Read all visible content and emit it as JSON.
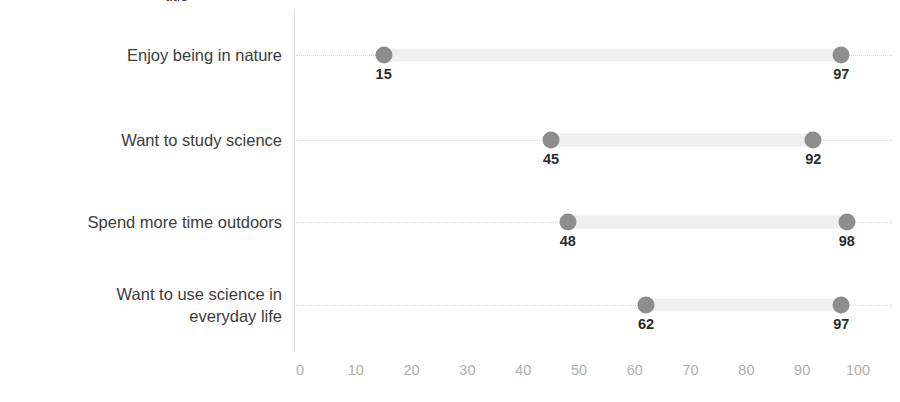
{
  "chart_data": {
    "type": "scatter",
    "subtype": "dumbbell-dot-plot",
    "title": "",
    "xlabel": "",
    "ylabel": "",
    "xlim": [
      0,
      100
    ],
    "xticks": [
      0,
      10,
      20,
      30,
      40,
      50,
      60,
      70,
      80,
      90,
      100
    ],
    "xticklabels": [
      "0",
      "10",
      "20",
      "30",
      "40",
      "50",
      "60",
      "70",
      "80",
      "90",
      "100"
    ],
    "grid": "horizontal-dotted",
    "legend": "none",
    "categories": [
      "Enjoy being in nature",
      "Want to study science",
      "Spend more time outdoors",
      "Want to use science in everyday life"
    ],
    "series": [
      {
        "name": "low",
        "values": [
          15,
          45,
          48,
          62
        ]
      },
      {
        "name": "high",
        "values": [
          97,
          92,
          98,
          97
        ]
      }
    ],
    "points": [
      {
        "category": "Enjoy being in nature",
        "low": 15,
        "high": 97,
        "low_label": "15",
        "high_label": "97"
      },
      {
        "category": "Want to study science",
        "low": 45,
        "high": 92,
        "low_label": "45",
        "high_label": "92"
      },
      {
        "category": "Spend more time outdoors",
        "low": 48,
        "high": 98,
        "low_label": "48",
        "high_label": "98"
      },
      {
        "category": "Want to use science in everyday life",
        "low": 62,
        "high": 97,
        "low_label": "62",
        "high_label": "97"
      }
    ],
    "colors": {
      "dot": "#8d8d8d",
      "connector": "#efefef",
      "gridline": "#d7d7d7",
      "axis": "#d8d8d8",
      "value_label": "#2b2b2b",
      "category_label": "#3c3c3c",
      "tick_label": "#aeaeae"
    }
  },
  "rows": [
    {
      "label": "Enjoy being in nature",
      "label_lines": 1,
      "y": 55,
      "low": 15,
      "high": 97,
      "low_label": "15",
      "high_label": "97"
    },
    {
      "label": "Want to study science",
      "label_lines": 1,
      "y": 140,
      "low": 45,
      "high": 92,
      "low_label": "45",
      "high_label": "92"
    },
    {
      "label": "Spend more time outdoors",
      "label_lines": 1,
      "y": 222,
      "low": 48,
      "high": 98,
      "low_label": "48",
      "high_label": "98"
    },
    {
      "label": "Want to use science in\neveryday life",
      "label_lines": 2,
      "y": 305,
      "low": 62,
      "high": 97,
      "low_label": "62",
      "high_label": "97"
    }
  ],
  "axis": {
    "x0_px": 300,
    "x100_px": 858,
    "ticks": [
      "0",
      "10",
      "20",
      "30",
      "40",
      "50",
      "60",
      "70",
      "80",
      "90",
      "100"
    ],
    "tick_values": [
      0,
      10,
      20,
      30,
      40,
      50,
      60,
      70,
      80,
      90,
      100
    ]
  },
  "title_sliver": "title"
}
